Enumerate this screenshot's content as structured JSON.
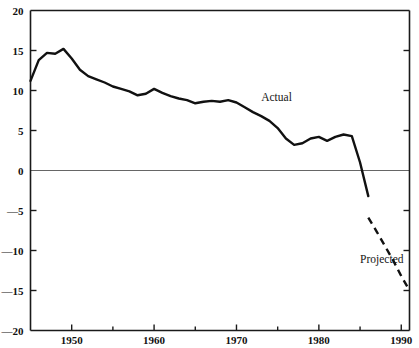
{
  "chart_data": {
    "type": "line",
    "title": "",
    "subtitle": "",
    "xlabel": "",
    "ylabel": "",
    "xlim": [
      1945,
      1991
    ],
    "ylim": [
      -20,
      20
    ],
    "grid": false,
    "zero_line": 0,
    "legend_position": "inline-annotation",
    "x_major_ticks": [
      1950,
      1960,
      1970,
      1980,
      1990
    ],
    "x_minor_ticks": [
      1945,
      1955,
      1965,
      1975,
      1985
    ],
    "x_tick_labels": [
      "1950",
      "1960",
      "1970",
      "1980",
      "1990"
    ],
    "y_ticks": [
      20,
      15,
      10,
      5,
      0,
      -5,
      -10,
      -15,
      -20
    ],
    "y_tick_labels": [
      "20",
      "15",
      "10",
      "5",
      "0",
      "—5",
      "—10",
      "—15",
      "—20"
    ],
    "annotations": [
      {
        "text": "Actual",
        "x": 1973,
        "y": 8.7
      },
      {
        "text": "Projected",
        "x": 1985,
        "y": -11.5
      }
    ],
    "series": [
      {
        "name": "Actual",
        "style": "solid",
        "color": "#111111",
        "x": [
          1945,
          1946,
          1947,
          1948,
          1949,
          1950,
          1951,
          1952,
          1953,
          1954,
          1955,
          1956,
          1957,
          1958,
          1959,
          1960,
          1961,
          1962,
          1963,
          1964,
          1965,
          1966,
          1967,
          1968,
          1969,
          1970,
          1971,
          1972,
          1973,
          1974,
          1975,
          1976,
          1977,
          1978,
          1979,
          1980,
          1981,
          1982,
          1983,
          1984,
          1985,
          1986
        ],
        "y": [
          11.2,
          13.8,
          14.7,
          14.6,
          15.2,
          14.0,
          12.6,
          11.8,
          11.4,
          11.0,
          10.5,
          10.2,
          9.9,
          9.4,
          9.6,
          10.2,
          9.7,
          9.3,
          9.0,
          8.8,
          8.4,
          8.6,
          8.7,
          8.6,
          8.8,
          8.5,
          7.9,
          7.3,
          6.8,
          6.2,
          5.3,
          4.0,
          3.2,
          3.4,
          4.0,
          4.2,
          3.7,
          4.2,
          4.5,
          4.3,
          1.0,
          -3.2
        ]
      },
      {
        "name": "Projected",
        "style": "dashed",
        "color": "#111111",
        "x": [
          1986,
          1987,
          1988,
          1989,
          1990,
          1991
        ],
        "y": [
          -5.9,
          -7.6,
          -9.4,
          -11.2,
          -13.2,
          -15.0
        ]
      }
    ]
  },
  "axes": {
    "left_axis_name": "left-axis",
    "right_axis_name": "right-axis",
    "bottom_axis_name": "bottom-axis",
    "top_axis_name": "top-axis"
  }
}
